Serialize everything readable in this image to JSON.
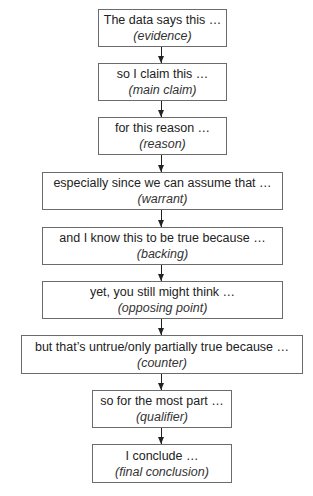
{
  "diagram": {
    "type": "flowchart",
    "direction": "top-to-bottom",
    "steps": [
      {
        "text": "The data says this …",
        "label": "(evidence)"
      },
      {
        "text": "so I claim this …",
        "label": "(main claim)"
      },
      {
        "text": "for this reason …",
        "label": "(reason)"
      },
      {
        "text": "especially since we can assume that …",
        "label": "(warrant)"
      },
      {
        "text": "and I know this to be true because …",
        "label": "(backing)"
      },
      {
        "text": "yet, you still might think …",
        "label": "(opposing point)"
      },
      {
        "text": "but that’s untrue/only partially true because …",
        "label": "(counter)"
      },
      {
        "text": "so for the most part …",
        "label": "(qualifier)"
      },
      {
        "text": "I conclude …",
        "label": "(final conclusion)"
      }
    ],
    "edges": [
      {
        "from": 0,
        "to": 1
      },
      {
        "from": 1,
        "to": 2
      },
      {
        "from": 2,
        "to": 3
      },
      {
        "from": 3,
        "to": 4
      },
      {
        "from": 4,
        "to": 5
      },
      {
        "from": 5,
        "to": 6
      },
      {
        "from": 6,
        "to": 7
      },
      {
        "from": 7,
        "to": 8
      }
    ],
    "colors": {
      "border": "#6b6b6b",
      "text": "#222222",
      "arrow": "#222222",
      "background": "#ffffff"
    }
  }
}
